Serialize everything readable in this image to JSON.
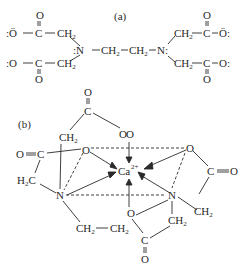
{
  "panel_a": {
    "label": "(a)",
    "molecule": "EDTA tetra-anion",
    "atoms": {
      "o_minus": ":Ö",
      "o_minus_right": "Ö:",
      "o_lone": ":O",
      "o_lone_right": "O:",
      "c": "C",
      "o": "O",
      "ch2": "CH",
      "sub2": "2",
      "n_left": ":N",
      "n_right": "N:",
      "bridge": "CH",
      "dash": "—"
    }
  },
  "panel_b": {
    "label": "(b)",
    "molecule": "Ca-EDTA chelate",
    "metal": "Ca",
    "charge": "2+",
    "atoms": {
      "o": "O",
      "c": "C",
      "n": "N",
      "ch2": "CH",
      "h2c": "H",
      "sub2": "2",
      "c_eq_o": "C",
      "o_eq": "O"
    }
  }
}
